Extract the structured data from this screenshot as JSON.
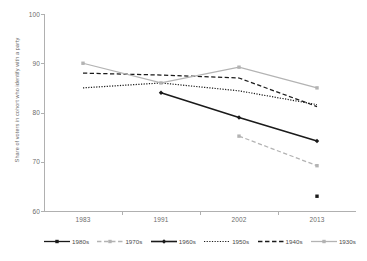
{
  "chart_data": {
    "type": "line",
    "title": "",
    "subtitle": "",
    "xlabel": "",
    "ylabel": "Share of voters in cohort who identify with a party",
    "categories": [
      "1983",
      "1991",
      "2002",
      "2013"
    ],
    "x_tick_labels": [
      "1983",
      "1991",
      "2002",
      "2013"
    ],
    "y_tick_labels": [
      "100",
      "90",
      "80",
      "70",
      "60"
    ],
    "ylim": [
      60,
      100
    ],
    "y_ticks": [
      60,
      70,
      80,
      90,
      100
    ],
    "grid": false,
    "legend_position": "bottom",
    "series": [
      {
        "name": "1980s",
        "color": "#1a1a1a",
        "style": "solid",
        "marker": "square",
        "x": [
          "2013"
        ],
        "values": [
          63.0
        ],
        "points": [
          {
            "x": "2013",
            "y": 63.0
          }
        ]
      },
      {
        "name": "1970s",
        "color": "#b3b3b3",
        "style": "dashed",
        "marker": "square",
        "x": [
          "2002",
          "2013"
        ],
        "values": [
          75.2,
          69.2
        ],
        "points": [
          {
            "x": "2002",
            "y": 75.2
          },
          {
            "x": "2013",
            "y": 69.2
          }
        ]
      },
      {
        "name": "1960s",
        "color": "#1a1a1a",
        "style": "solid",
        "marker": "diamond",
        "x": [
          "1991",
          "2002",
          "2013"
        ],
        "values": [
          84.0,
          79.0,
          74.2
        ],
        "points": [
          {
            "x": "1991",
            "y": 84.0
          },
          {
            "x": "2002",
            "y": 79.0
          },
          {
            "x": "2013",
            "y": 74.2
          }
        ]
      },
      {
        "name": "1950s",
        "color": "#1a1a1a",
        "style": "dotted",
        "marker": "none",
        "x": [
          "1983",
          "1991",
          "2002",
          "2013"
        ],
        "values": [
          85.0,
          86.0,
          84.4,
          81.6
        ],
        "points": [
          {
            "x": "1983",
            "y": 85.0
          },
          {
            "x": "1991",
            "y": 86.0
          },
          {
            "x": "2002",
            "y": 84.4
          },
          {
            "x": "2013",
            "y": 81.6
          }
        ]
      },
      {
        "name": "1940s",
        "color": "#1a1a1a",
        "style": "dashed",
        "marker": "none",
        "x": [
          "1983",
          "1991",
          "2002",
          "2013"
        ],
        "values": [
          88.0,
          87.6,
          87.0,
          81.2
        ],
        "points": [
          {
            "x": "1983",
            "y": 88.0
          },
          {
            "x": "1991",
            "y": 87.6
          },
          {
            "x": "2002",
            "y": 87.0
          },
          {
            "x": "2013",
            "y": 81.2
          }
        ]
      },
      {
        "name": "1930s",
        "color": "#b3b3b3",
        "style": "solid",
        "marker": "square",
        "x": [
          "1983",
          "1991",
          "2002",
          "2013"
        ],
        "values": [
          90.0,
          86.0,
          89.2,
          85.0
        ],
        "points": [
          {
            "x": "1983",
            "y": 90.0
          },
          {
            "x": "1991",
            "y": 86.0
          },
          {
            "x": "2002",
            "y": 89.2
          },
          {
            "x": "2013",
            "y": 85.0
          }
        ]
      }
    ]
  },
  "legend": {
    "items": [
      {
        "label": "1980s"
      },
      {
        "label": "1970s"
      },
      {
        "label": "1960s"
      },
      {
        "label": "1950s"
      },
      {
        "label": "1940s"
      },
      {
        "label": "1930s"
      }
    ]
  },
  "axes": {
    "y_labels": [
      "100",
      "90",
      "80",
      "70",
      "60"
    ],
    "x_labels": [
      "1983",
      "1991",
      "2002",
      "2013"
    ],
    "y_title": "Share of voters in cohort who identify with a party"
  },
  "colors": {
    "dark": "#1a1a1a",
    "light": "#b3b3b3",
    "axis": "#b0b0b0",
    "text": "#6b6b6b",
    "background": "#ffffff"
  }
}
